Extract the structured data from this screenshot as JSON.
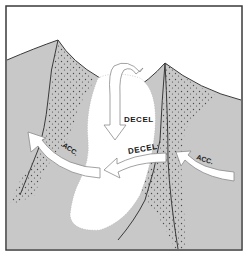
{
  "diagram": {
    "labels": {
      "decel_top": "DECEL",
      "decel_lower": "DECEL",
      "acc_left": "ACC.",
      "acc_right": "ACC."
    },
    "colors": {
      "background": "#ffffff",
      "terrain_fill": "#c8c8c8",
      "terrain_outline": "#3a3a3a",
      "stipple": "#4a4a4a",
      "clear_zone": "#ffffff",
      "arrow_fill": "#ffffff",
      "arrow_outline": "#8a8a8a",
      "frame": "#3a3a3a",
      "text": "#1a1a1a"
    },
    "elements": [
      {
        "id": "left-ridge",
        "type": "terrain"
      },
      {
        "id": "right-ridge",
        "type": "terrain"
      },
      {
        "id": "decel-zone",
        "type": "clear-region"
      },
      {
        "id": "downdraft-arrow",
        "type": "arrow",
        "direction": "down"
      },
      {
        "id": "left-acc-arrow",
        "type": "arrow",
        "direction": "left"
      },
      {
        "id": "center-decel-arrow",
        "type": "arrow",
        "direction": "left"
      },
      {
        "id": "right-acc-arrow",
        "type": "arrow",
        "direction": "left"
      }
    ]
  }
}
